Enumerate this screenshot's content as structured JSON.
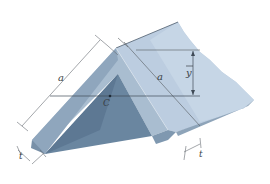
{
  "diagram": {
    "type": "equal-leg angle cross-section",
    "labels": {
      "leg_left": "a",
      "leg_right": "a",
      "centroid": "C",
      "ybar": "y",
      "thickness_left": "t",
      "thickness_right": "t"
    },
    "colors": {
      "top_face": "#b9cbdc",
      "top_face_light": "#c9d8e6",
      "end_face_left": "#8fa6bc",
      "inner_face": "#6f8aa3",
      "inner_dark": "#5f7a94",
      "right_end_face": "#7e97ae",
      "dimension_line": "#555a60",
      "label": "#3a3f46"
    }
  }
}
